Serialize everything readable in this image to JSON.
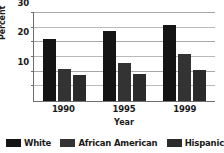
{
  "title_remnant": "·· ·",
  "legend": {
    "position": "bottom",
    "items": [
      {
        "label": "White",
        "color": "#141414"
      },
      {
        "label": "African American",
        "color": "#333333"
      },
      {
        "label": "Hispanic",
        "color": "#2b2b2b"
      }
    ]
  },
  "axes": {
    "ylabel": "Percent",
    "xlabel": "Year",
    "yticks": [
      "10",
      "20",
      "30"
    ],
    "xticks": [
      "1990",
      "1995",
      "1999"
    ]
  },
  "chart_data": {
    "type": "bar",
    "title": "",
    "xlabel": "Year",
    "ylabel": "Percent",
    "categories": [
      "1990",
      "1995",
      "1999"
    ],
    "series": [
      {
        "name": "White",
        "color": "#141414",
        "values": [
          21,
          24,
          26
        ]
      },
      {
        "name": "African American",
        "color": "#333333",
        "values": [
          11,
          13,
          16
        ]
      },
      {
        "name": "Hispanic",
        "color": "#2b2b2b",
        "values": [
          9,
          9.3,
          10.5
        ]
      }
    ],
    "ylim": [
      0,
      30
    ],
    "ytick_values": [
      10,
      20,
      30
    ],
    "gridline_values": [
      5,
      10,
      15,
      20,
      25,
      30
    ],
    "grid": true,
    "legend_position": "bottom"
  }
}
